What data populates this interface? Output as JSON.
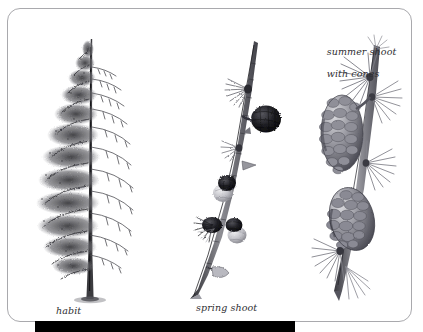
{
  "plate": {
    "background_color": "#ffffff",
    "card": {
      "border_color": "#a9a9ad",
      "fill_color": "#ffffff"
    },
    "bottom_bar": {
      "color": "#000000"
    },
    "ink_color": "#2e2e32"
  },
  "captions": {
    "habit": "habit",
    "spring_shoot": "spring shoot",
    "summer_shoot_line1": "summer shoot",
    "summer_shoot_line2": "with cones"
  },
  "figures": {
    "habit": {
      "name": "larch-tree-habit",
      "description": "full conifer tree, foliage on left half, bare branch structure on right half"
    },
    "spring_shoot": {
      "name": "larch-spring-shoot",
      "description": "diagonal twig with dark young cones and needle tufts"
    },
    "summer_shoot": {
      "name": "larch-summer-shoot-with-cones",
      "description": "shoot bearing two mature scaly cones and radiating needle rosettes"
    }
  }
}
